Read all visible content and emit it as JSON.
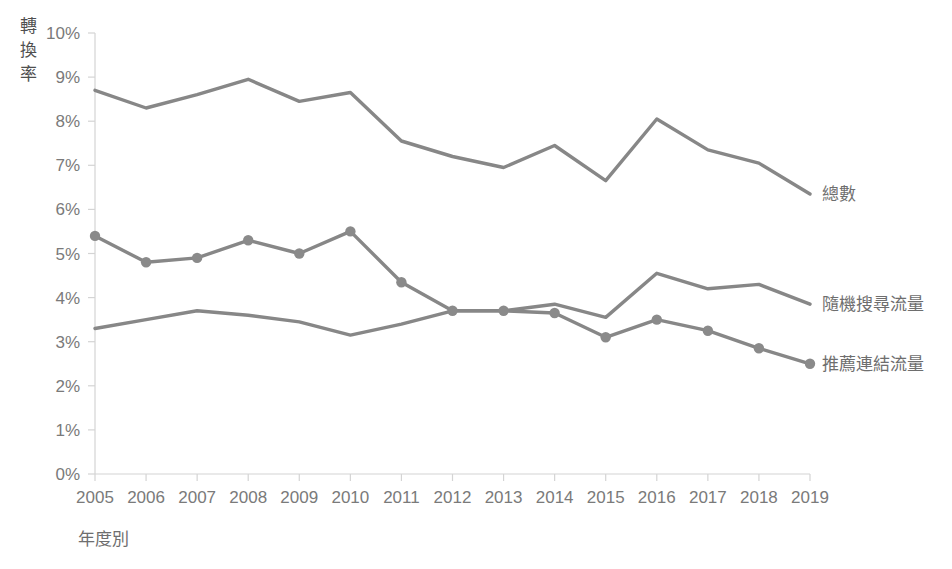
{
  "chart_data": {
    "type": "line",
    "title": "",
    "xlabel": "年度別",
    "ylabel": "轉換率",
    "categories": [
      "2005",
      "2006",
      "2007",
      "2008",
      "2009",
      "2010",
      "2011",
      "2012",
      "2013",
      "2014",
      "2015",
      "2016",
      "2017",
      "2018",
      "2019"
    ],
    "x": [
      2005,
      2006,
      2007,
      2008,
      2009,
      2010,
      2011,
      2012,
      2013,
      2014,
      2015,
      2016,
      2017,
      2018,
      2019
    ],
    "ylim": [
      0,
      10
    ],
    "ytick_labels": [
      "0%",
      "1%",
      "2%",
      "3%",
      "4%",
      "5%",
      "6%",
      "7%",
      "8%",
      "9%",
      "10%"
    ],
    "ytick_values": [
      0,
      1,
      2,
      3,
      4,
      5,
      6,
      7,
      8,
      9,
      10
    ],
    "grid": false,
    "legend_position": "right-inline-labels",
    "series": [
      {
        "name": "總數",
        "values": [
          8.7,
          8.3,
          8.6,
          8.95,
          8.45,
          8.65,
          7.55,
          7.2,
          6.95,
          7.45,
          6.65,
          8.05,
          7.35,
          7.05,
          6.35
        ],
        "color": "#878787",
        "markers": false,
        "label_value": 6.35
      },
      {
        "name": "隨機搜尋流量",
        "values": [
          3.3,
          3.5,
          3.7,
          3.6,
          3.45,
          3.15,
          3.4,
          3.7,
          3.7,
          3.85,
          3.55,
          4.55,
          4.2,
          4.3,
          3.85
        ],
        "color": "#878787",
        "markers": false,
        "label_value": 3.85
      },
      {
        "name": "推薦連結流量",
        "values": [
          5.4,
          4.8,
          4.9,
          5.3,
          5.0,
          5.5,
          4.35,
          3.7,
          3.7,
          3.65,
          3.1,
          3.5,
          3.25,
          2.85,
          2.5
        ],
        "color": "#8a8a8a",
        "markers": true,
        "label_value": 2.5
      }
    ]
  },
  "axis": {
    "y_title": "轉換率",
    "y_title_chars": [
      "轉",
      "換",
      "率"
    ],
    "x_title": "年度別"
  },
  "colors": {
    "line": "#878787",
    "axis": "#d4d4d4",
    "tick_text": "#7a7a7a",
    "label_text": "#6e6e6e",
    "background": "#ffffff"
  }
}
